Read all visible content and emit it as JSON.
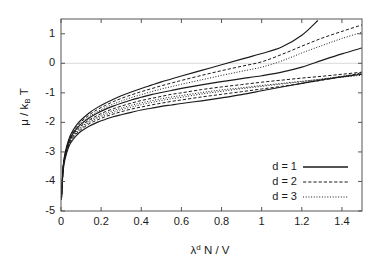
{
  "chart_data": {
    "type": "line",
    "title": "",
    "xlabel": "λᵈ N / V",
    "ylabel": "μ / kʙ T",
    "xlabel_parts": {
      "base": "λ",
      "sup": "d",
      "rest": "N / V"
    },
    "ylabel_parts": {
      "mu": "μ",
      "slash": "/",
      "k": "k",
      "sub": "B",
      "t": "T"
    },
    "xlim": [
      0,
      1.5
    ],
    "ylim": [
      -5,
      1.5
    ],
    "xticks": [
      0,
      0.2,
      0.4,
      0.6,
      0.8,
      1,
      1.2,
      1.4
    ],
    "xtick_labels": [
      "0",
      "0.2",
      "0.4",
      "0.6",
      "0.8",
      "1",
      "1.2",
      "1.4"
    ],
    "yticks": [
      1,
      0,
      -1,
      -2,
      -3,
      -4,
      -5
    ],
    "ytick_labels": [
      "1",
      "0",
      "-1",
      "-2",
      "-3",
      "-4",
      "-5"
    ],
    "grid": false,
    "zero_line": true,
    "zero_line_color": "#d9d9d9",
    "axis_color": "#555555",
    "line_color": "#1a1a1a",
    "legend": {
      "position": "lower-right",
      "entries": [
        {
          "label": "d = 1",
          "style": "solid"
        },
        {
          "label": "d = 2",
          "style": "dashed"
        },
        {
          "label": "d = 3",
          "style": "dotted"
        }
      ]
    },
    "series": [
      {
        "name": "d = 1, upper branch",
        "dimension": 1,
        "style": "solid",
        "branch": "upper",
        "x": [
          0.002,
          0.01,
          0.02,
          0.04,
          0.06,
          0.08,
          0.1,
          0.14,
          0.18,
          0.22,
          0.26,
          0.3,
          0.35,
          0.4,
          0.45,
          0.5,
          0.55,
          0.6,
          0.7,
          0.8,
          0.9,
          1.0,
          1.1,
          1.2,
          1.28
        ],
        "y": [
          -4.6,
          -3.55,
          -3.05,
          -2.55,
          -2.27,
          -2.07,
          -1.92,
          -1.68,
          -1.5,
          -1.35,
          -1.22,
          -1.1,
          -0.97,
          -0.85,
          -0.74,
          -0.63,
          -0.53,
          -0.43,
          -0.24,
          -0.05,
          0.14,
          0.33,
          0.55,
          0.95,
          1.45
        ]
      },
      {
        "name": "d = 2, upper branch",
        "dimension": 2,
        "style": "dashed",
        "branch": "upper",
        "x": [
          0.002,
          0.01,
          0.02,
          0.04,
          0.06,
          0.08,
          0.1,
          0.14,
          0.18,
          0.22,
          0.26,
          0.3,
          0.35,
          0.4,
          0.45,
          0.5,
          0.55,
          0.6,
          0.7,
          0.8,
          0.9,
          1.0,
          1.1,
          1.2,
          1.3,
          1.4,
          1.5
        ],
        "y": [
          -4.6,
          -3.57,
          -3.08,
          -2.59,
          -2.32,
          -2.13,
          -1.98,
          -1.75,
          -1.57,
          -1.43,
          -1.3,
          -1.19,
          -1.07,
          -0.96,
          -0.86,
          -0.76,
          -0.67,
          -0.58,
          -0.41,
          -0.25,
          -0.1,
          0.05,
          0.3,
          0.58,
          0.85,
          1.08,
          1.3
        ]
      },
      {
        "name": "d = 3, upper branch",
        "dimension": 3,
        "style": "dotted",
        "branch": "upper",
        "x": [
          0.002,
          0.01,
          0.02,
          0.04,
          0.06,
          0.08,
          0.1,
          0.14,
          0.18,
          0.22,
          0.26,
          0.3,
          0.35,
          0.4,
          0.45,
          0.5,
          0.55,
          0.6,
          0.7,
          0.8,
          0.9,
          1.0,
          1.1,
          1.2,
          1.3,
          1.4,
          1.5
        ],
        "y": [
          -4.6,
          -3.58,
          -3.1,
          -2.62,
          -2.36,
          -2.17,
          -2.03,
          -1.81,
          -1.64,
          -1.5,
          -1.38,
          -1.28,
          -1.16,
          -1.06,
          -0.96,
          -0.87,
          -0.79,
          -0.71,
          -0.56,
          -0.41,
          -0.27,
          -0.13,
          0.08,
          0.35,
          0.6,
          0.84,
          1.05
        ]
      },
      {
        "name": "d = 1, middle branch",
        "dimension": 1,
        "style": "solid",
        "branch": "middle",
        "x": [
          0.002,
          0.01,
          0.02,
          0.04,
          0.06,
          0.08,
          0.1,
          0.14,
          0.18,
          0.22,
          0.26,
          0.3,
          0.35,
          0.4,
          0.45,
          0.5,
          0.55,
          0.6,
          0.7,
          0.8,
          0.9,
          1.0,
          1.1,
          1.2,
          1.3,
          1.4,
          1.5
        ],
        "y": [
          -4.6,
          -3.6,
          -3.12,
          -2.64,
          -2.38,
          -2.2,
          -2.06,
          -1.85,
          -1.69,
          -1.56,
          -1.45,
          -1.35,
          -1.24,
          -1.15,
          -1.06,
          -0.99,
          -0.92,
          -0.85,
          -0.73,
          -0.62,
          -0.52,
          -0.42,
          -0.3,
          -0.13,
          0.1,
          0.32,
          0.52
        ]
      },
      {
        "name": "d = 2, middle branch",
        "dimension": 2,
        "style": "dashed",
        "branch": "middle",
        "x": [
          0.002,
          0.01,
          0.02,
          0.04,
          0.06,
          0.08,
          0.1,
          0.14,
          0.18,
          0.22,
          0.26,
          0.3,
          0.35,
          0.4,
          0.45,
          0.5,
          0.55,
          0.6,
          0.7,
          0.8,
          0.9,
          1.0,
          1.1,
          1.2,
          1.3,
          1.4,
          1.5
        ],
        "y": [
          -4.6,
          -3.62,
          -3.15,
          -2.68,
          -2.43,
          -2.25,
          -2.12,
          -1.92,
          -1.77,
          -1.64,
          -1.54,
          -1.45,
          -1.35,
          -1.26,
          -1.19,
          -1.12,
          -1.05,
          -1.0,
          -0.89,
          -0.8,
          -0.72,
          -0.64,
          -0.57,
          -0.5,
          -0.44,
          -0.37,
          -0.3
        ]
      },
      {
        "name": "d = 3, middle branch",
        "dimension": 3,
        "style": "dotted",
        "branch": "middle",
        "x": [
          0.002,
          0.01,
          0.02,
          0.04,
          0.06,
          0.08,
          0.1,
          0.14,
          0.18,
          0.22,
          0.26,
          0.3,
          0.35,
          0.4,
          0.45,
          0.5,
          0.55,
          0.6,
          0.7,
          0.8,
          0.9,
          1.0,
          1.1,
          1.2,
          1.3,
          1.4,
          1.5
        ],
        "y": [
          -4.6,
          -3.63,
          -3.17,
          -2.71,
          -2.46,
          -2.29,
          -2.16,
          -1.96,
          -1.82,
          -1.7,
          -1.6,
          -1.52,
          -1.42,
          -1.34,
          -1.27,
          -1.2,
          -1.14,
          -1.09,
          -0.99,
          -0.9,
          -0.83,
          -0.75,
          -0.68,
          -0.61,
          -0.54,
          -0.47,
          -0.4
        ]
      },
      {
        "name": "d = 3, lower branch",
        "dimension": 3,
        "style": "dotted",
        "branch": "lower",
        "x": [
          0.002,
          0.01,
          0.02,
          0.04,
          0.06,
          0.08,
          0.1,
          0.14,
          0.18,
          0.22,
          0.26,
          0.3,
          0.35,
          0.4,
          0.45,
          0.5,
          0.55,
          0.6,
          0.7,
          0.8,
          0.9,
          1.0,
          1.1,
          1.2,
          1.3,
          1.4,
          1.5
        ],
        "y": [
          -4.6,
          -3.64,
          -3.18,
          -2.73,
          -2.49,
          -2.32,
          -2.2,
          -2.0,
          -1.86,
          -1.75,
          -1.66,
          -1.57,
          -1.48,
          -1.4,
          -1.33,
          -1.26,
          -1.2,
          -1.15,
          -1.04,
          -0.95,
          -0.86,
          -0.78,
          -0.7,
          -0.62,
          -0.53,
          -0.44,
          -0.35
        ]
      },
      {
        "name": "d = 2, lower branch",
        "dimension": 2,
        "style": "dashed",
        "branch": "lower",
        "x": [
          0.002,
          0.01,
          0.02,
          0.04,
          0.06,
          0.08,
          0.1,
          0.14,
          0.18,
          0.22,
          0.26,
          0.3,
          0.35,
          0.4,
          0.45,
          0.5,
          0.55,
          0.6,
          0.7,
          0.8,
          0.9,
          1.0,
          1.1,
          1.2,
          1.3,
          1.4,
          1.5
        ],
        "y": [
          -4.6,
          -3.66,
          -3.2,
          -2.76,
          -2.52,
          -2.36,
          -2.24,
          -2.05,
          -1.92,
          -1.81,
          -1.72,
          -1.64,
          -1.55,
          -1.48,
          -1.41,
          -1.35,
          -1.29,
          -1.24,
          -1.14,
          -1.05,
          -0.96,
          -0.87,
          -0.78,
          -0.68,
          -0.57,
          -0.45,
          -0.32
        ]
      },
      {
        "name": "d = 1, lower branch",
        "dimension": 1,
        "style": "solid",
        "branch": "lower",
        "x": [
          0.002,
          0.01,
          0.02,
          0.04,
          0.06,
          0.08,
          0.1,
          0.14,
          0.18,
          0.22,
          0.26,
          0.3,
          0.35,
          0.4,
          0.45,
          0.5,
          0.55,
          0.6,
          0.7,
          0.8,
          0.9,
          1.0,
          1.1,
          1.2,
          1.3,
          1.4,
          1.5
        ],
        "y": [
          -4.6,
          -3.68,
          -3.24,
          -2.8,
          -2.58,
          -2.42,
          -2.3,
          -2.13,
          -2.0,
          -1.9,
          -1.81,
          -1.74,
          -1.66,
          -1.58,
          -1.52,
          -1.46,
          -1.41,
          -1.36,
          -1.27,
          -1.17,
          -1.06,
          -0.93,
          -0.8,
          -0.68,
          -0.56,
          -0.46,
          -0.37
        ]
      }
    ]
  }
}
